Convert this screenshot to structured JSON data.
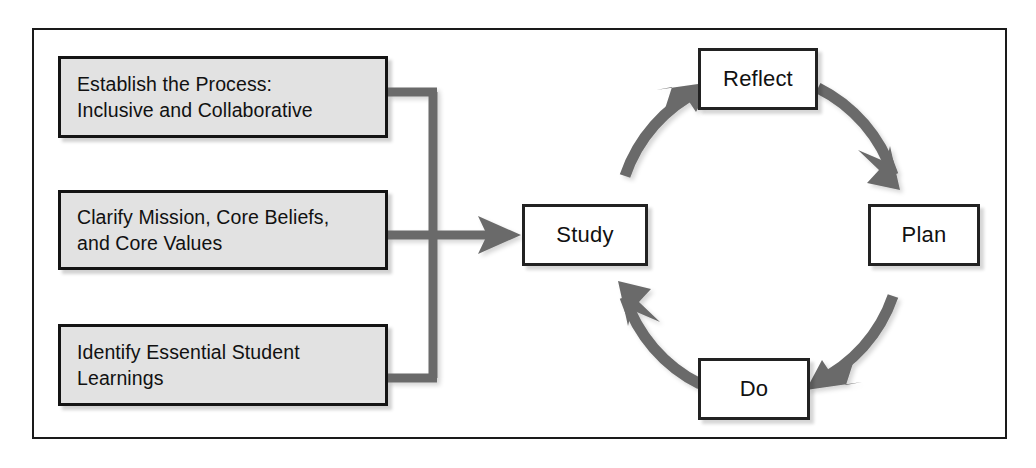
{
  "diagram": {
    "colors": {
      "box_fill_gray": "#e2e2e2",
      "box_fill_white": "#ffffff",
      "box_border": "#141414",
      "arrow_gray": "#6b6b6b",
      "frame_border": "#1a1a1a",
      "text": "#111111"
    },
    "frame": {
      "label": "diagram-frame"
    },
    "inputs": [
      {
        "id": "establish-the-process",
        "lines": [
          "Establish the Process:",
          "Inclusive and Collaborative"
        ]
      },
      {
        "id": "clarify-mission",
        "lines": [
          "Clarify Mission, Core Beliefs,",
          "and Core Values"
        ]
      },
      {
        "id": "identify-essential-student-learnings",
        "lines": [
          "Identify Essential Student",
          "Learnings"
        ]
      }
    ],
    "cycle": {
      "center": {
        "x": 760,
        "y": 235
      },
      "radius": 148,
      "nodes": [
        {
          "id": "reflect",
          "label": "Reflect",
          "position": "top"
        },
        {
          "id": "plan",
          "label": "Plan",
          "position": "right"
        },
        {
          "id": "do",
          "label": "Do",
          "position": "bottom"
        },
        {
          "id": "study",
          "label": "Study",
          "position": "left"
        }
      ],
      "arrows": [
        {
          "from": "reflect",
          "to": "plan",
          "direction": "clockwise"
        },
        {
          "from": "plan",
          "to": "do",
          "direction": "clockwise"
        },
        {
          "from": "do",
          "to": "study",
          "direction": "clockwise"
        },
        {
          "from": "study",
          "to": "reflect",
          "direction": "clockwise"
        }
      ]
    },
    "connector": {
      "id": "inputs-to-study-connector",
      "description": "Three input boxes join a vertical trunk that feeds an arrow into Study",
      "target": "study"
    }
  }
}
